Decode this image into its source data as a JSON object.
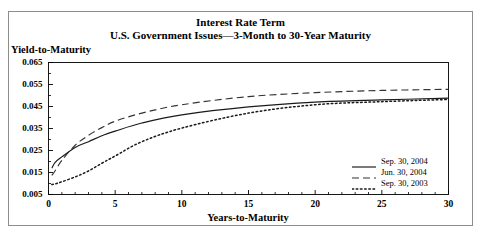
{
  "figure": {
    "title_line1": "Interest Rate Term",
    "title_line2": "U.S. Government Issues—3-Month to 30-Year Maturity",
    "border_color": "#8d8d8d",
    "axis_color": "#000000",
    "background": "#ffffff"
  },
  "chart_data": {
    "type": "line",
    "title": "Interest Rate Term",
    "subtitle": "U.S. Government Issues—3-Month to 30-Year Maturity",
    "xlabel": "Years-to-Maturity",
    "ylabel": "Yield-to-Maturity",
    "xlim": [
      0,
      30
    ],
    "ylim": [
      0.005,
      0.065
    ],
    "xticks": [
      0,
      5,
      10,
      15,
      20,
      25,
      30
    ],
    "yticks": [
      0.005,
      0.015,
      0.025,
      0.035,
      0.045,
      0.055,
      0.065
    ],
    "xtick_labels": [
      "0",
      "5",
      "10",
      "15",
      "20",
      "25",
      "30"
    ],
    "ytick_labels": [
      "0.005",
      "0.015",
      "0.025",
      "0.035",
      "0.045",
      "0.055",
      "0.065"
    ],
    "grid": false,
    "legend_position": "lower right",
    "x": [
      0.25,
      0.5,
      1,
      2,
      3,
      4,
      5,
      7,
      10,
      15,
      20,
      25,
      30
    ],
    "series": [
      {
        "name": "Sep. 30, 2004",
        "style": "solid",
        "color": "#1a1a1a",
        "values": [
          0.017,
          0.0196,
          0.0221,
          0.0264,
          0.029,
          0.0317,
          0.0338,
          0.0375,
          0.0412,
          0.0448,
          0.047,
          0.048,
          0.0488
        ]
      },
      {
        "name": "Jun. 30, 2004",
        "style": "dashed",
        "color": "#333333",
        "values": [
          0.0137,
          0.0158,
          0.0205,
          0.0274,
          0.0319,
          0.0354,
          0.0383,
          0.042,
          0.0458,
          0.0495,
          0.0513,
          0.0523,
          0.0528
        ]
      },
      {
        "name": "Sep. 30, 2003",
        "style": "dotted",
        "color": "#1a1a1a",
        "values": [
          0.0095,
          0.0098,
          0.0108,
          0.013,
          0.0157,
          0.0192,
          0.0225,
          0.029,
          0.0352,
          0.042,
          0.0458,
          0.0472,
          0.0482
        ]
      }
    ]
  },
  "legend": {
    "items": [
      {
        "label": "Sep. 30, 2004",
        "style": "solid"
      },
      {
        "label": "Jun. 30, 2004",
        "style": "dashed"
      },
      {
        "label": "Sep. 30, 2003",
        "style": "dotted"
      }
    ]
  }
}
